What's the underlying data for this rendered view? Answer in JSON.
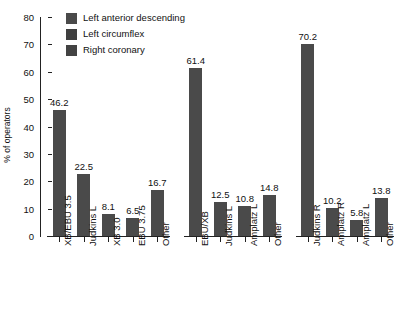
{
  "chart_data": {
    "type": "bar",
    "title": "",
    "xlabel": "",
    "ylabel": "% of operators",
    "ylim": [
      0,
      80
    ],
    "ytick_step": 10,
    "yticks": [
      "0",
      "10",
      "20",
      "30",
      "40",
      "50",
      "60",
      "70",
      "80"
    ],
    "grid": false,
    "legend_position": "top-left",
    "bar_color": "#4a4a4a",
    "axis_color": "#222222",
    "background": "#ffffff",
    "legend": [
      {
        "label": "Left anterior descending",
        "color": "#4a4a4a"
      },
      {
        "label": "Left circumflex",
        "color": "#3f3f3f"
      },
      {
        "label": "Right coronary",
        "color": "#434343"
      }
    ],
    "groups": [
      {
        "name": "Left anterior descending",
        "categories": [
          "XB/EBU 3.5",
          "Judkins L",
          "XB 3.0",
          "EBU 3.75",
          "Other"
        ],
        "values": [
          46.2,
          22.5,
          8.1,
          6.5,
          16.7
        ],
        "value_labels": [
          "46.2",
          "22.5",
          "8.1",
          "6.5",
          "16.7"
        ]
      },
      {
        "name": "Left circumflex",
        "categories": [
          "EBU/XB",
          "Judkins L",
          "Amplatz L",
          "Other"
        ],
        "values": [
          61.4,
          12.5,
          10.8,
          14.8
        ],
        "value_labels": [
          "61.4",
          "12.5",
          "10.8",
          "14.8"
        ]
      },
      {
        "name": "Right coronary",
        "categories": [
          "Judkins R",
          "Amplatz R",
          "Amplatz L",
          "Other"
        ],
        "values": [
          70.2,
          10.2,
          5.8,
          13.8
        ],
        "value_labels": [
          "70.2",
          "10.2",
          "5.8",
          "13.8"
        ]
      }
    ]
  }
}
